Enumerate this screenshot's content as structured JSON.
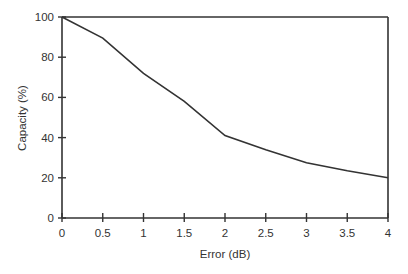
{
  "chart_data": {
    "type": "line",
    "title": "",
    "xlabel": "Error (dB)",
    "ylabel": "Capacity (%)",
    "x": [
      0,
      0.5,
      1,
      1.5,
      2,
      2.5,
      3,
      3.5,
      4
    ],
    "series": [
      {
        "name": "Capacity",
        "values": [
          100,
          89.5,
          72,
          58,
          41,
          34,
          27.5,
          23.5,
          20
        ]
      }
    ],
    "xlim": [
      0,
      4
    ],
    "ylim": [
      0,
      100
    ],
    "xticks": [
      "0",
      "0.5",
      "1",
      "1.5",
      "2",
      "2.5",
      "3",
      "3.5",
      "4"
    ],
    "yticks": [
      "0",
      "20",
      "40",
      "60",
      "80",
      "100"
    ],
    "grid": false,
    "legend": null
  }
}
